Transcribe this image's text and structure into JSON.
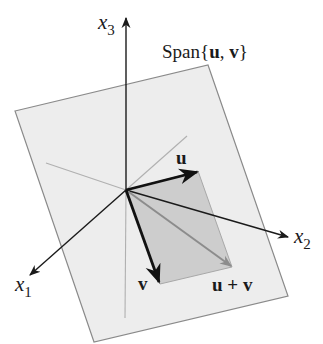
{
  "figure": {
    "title": "Span{u, v}",
    "span_label": {
      "prefix": "Span{",
      "u": "u",
      "comma": ", ",
      "v": "v",
      "suffix": "}"
    },
    "axes": {
      "x1": {
        "base": "x",
        "sub": "1"
      },
      "x2": {
        "base": "x",
        "sub": "2"
      },
      "x3": {
        "base": "x",
        "sub": "3"
      }
    },
    "vectors": {
      "u": "u",
      "v": "v",
      "u_plus_v": "u + v"
    },
    "colors": {
      "plane_fill": "#ededed",
      "plane_stroke": "#8a8a8a",
      "parallelogram_fill": "#cdcdcd",
      "axis_stroke": "#1a1a1a",
      "hidden_axis_stroke": "#b0b0b0",
      "vector_stroke": "#111111",
      "sum_vector_stroke": "#8c8c8c"
    }
  }
}
